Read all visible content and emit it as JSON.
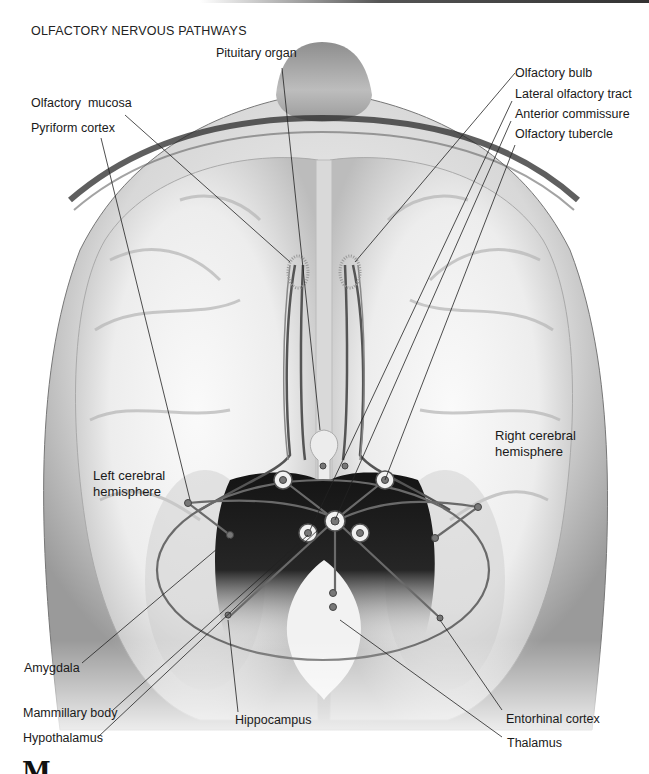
{
  "figure": {
    "title": "OLFACTORY NERVOUS PATHWAYS",
    "labels": {
      "pituitary_organ": "Pituitary organ",
      "olfactory_mucosa": "Olfactory  mucosa",
      "pyriform_cortex": "Pyriform cortex",
      "olfactory_bulb": "Olfactory bulb",
      "lateral_olfactory_tract": "Lateral olfactory tract",
      "anterior_commissure": "Anterior commissure",
      "olfactory_tubercle": "Olfactory tubercle",
      "left_hemisphere": "Left cerebral hemisphere",
      "right_hemisphere": "Right cerebral hemisphere",
      "amygdala": "Amygdala",
      "mammillary_body": "Mammillary body",
      "hypothalamus": "Hypothalamus",
      "hippocampus": "Hippocampus",
      "entorhinal_cortex": "Entorhinal cortex",
      "thalamus": "Thalamus"
    },
    "next_section_heading_partial": "M"
  }
}
